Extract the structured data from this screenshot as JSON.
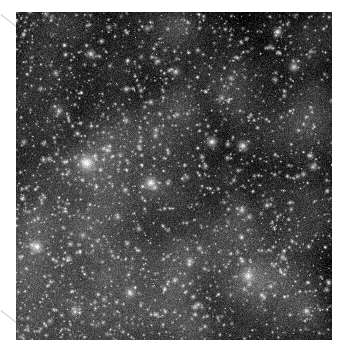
{
  "page": {
    "background_color": "#ffffff",
    "width": 348,
    "height": 354,
    "figure_alt": "Dense grayscale star field of a globular cluster core"
  },
  "plate": {
    "name": "star-field-image",
    "x": 16,
    "y": 12,
    "width": 316,
    "height": 328,
    "background_color": "#050505",
    "colormap": "grayscale",
    "star_color": "#ffffff"
  },
  "marks": {
    "crop_tick_color": "#c9c9c9",
    "crop_tick_top_left": "diagonal-registration-tick",
    "crop_tick_bottom_left": "diagonal-registration-tick"
  },
  "chart_data": {
    "type": "scatter",
    "title": "",
    "subtitle": "",
    "xlabel": "",
    "ylabel": "",
    "xlim": [
      0,
      316
    ],
    "ylim": [
      0,
      328
    ],
    "grid": false,
    "legend_position": "none",
    "tick_labels": {
      "x": [],
      "y": []
    },
    "annotations": [],
    "background_color": "#050505",
    "point_color": "#ffffff",
    "field_stats": {
      "faint_star_count": 5200,
      "medium_star_count": 900,
      "bright_star_count": 120,
      "sky_level": 6,
      "peak_level": 255
    },
    "brightness_gradient": {
      "description": "Sky slightly brighter toward the left and lower-left, darker toward the upper right",
      "bright_corner": "left",
      "dark_corner": "upper-right"
    },
    "bright_stars": [
      {
        "x": 71,
        "y": 151,
        "radius": 11,
        "brightness": 1.0
      },
      {
        "x": 135,
        "y": 171,
        "radius": 8,
        "brightness": 0.95
      },
      {
        "x": 21,
        "y": 235,
        "radius": 8,
        "brightness": 0.92
      },
      {
        "x": 196,
        "y": 130,
        "radius": 7,
        "brightness": 0.85
      },
      {
        "x": 227,
        "y": 134,
        "radius": 7,
        "brightness": 0.82
      },
      {
        "x": 232,
        "y": 264,
        "radius": 8,
        "brightness": 0.88
      },
      {
        "x": 114,
        "y": 281,
        "radius": 6,
        "brightness": 0.78
      },
      {
        "x": 75,
        "y": 42,
        "radius": 6,
        "brightness": 0.74
      },
      {
        "x": 262,
        "y": 20,
        "radius": 6,
        "brightness": 0.76
      },
      {
        "x": 278,
        "y": 55,
        "radius": 6,
        "brightness": 0.72
      },
      {
        "x": 160,
        "y": 60,
        "radius": 5,
        "brightness": 0.7
      },
      {
        "x": 43,
        "y": 99,
        "radius": 5,
        "brightness": 0.68
      },
      {
        "x": 297,
        "y": 155,
        "radius": 5,
        "brightness": 0.66
      },
      {
        "x": 226,
        "y": 198,
        "radius": 5,
        "brightness": 0.64
      },
      {
        "x": 59,
        "y": 300,
        "radius": 5,
        "brightness": 0.69
      },
      {
        "x": 174,
        "y": 249,
        "radius": 5,
        "brightness": 0.62
      },
      {
        "x": 290,
        "y": 299,
        "radius": 5,
        "brightness": 0.6
      },
      {
        "x": 102,
        "y": 205,
        "radius": 4,
        "brightness": 0.58
      },
      {
        "x": 206,
        "y": 86,
        "radius": 4,
        "brightness": 0.57
      },
      {
        "x": 140,
        "y": 118,
        "radius": 4,
        "brightness": 0.55
      }
    ]
  }
}
